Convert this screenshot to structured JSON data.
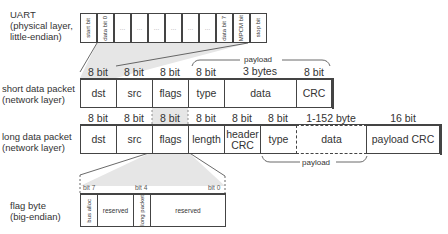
{
  "uart": {
    "label_lines": [
      "UART",
      "(physical layer,",
      " little-endian)"
    ],
    "cells": [
      "start bit",
      "data bit 0",
      "…",
      "…",
      "…",
      "…",
      "…",
      "…",
      "data bit 7",
      "MPCM bit",
      "stop bit"
    ]
  },
  "short_packet": {
    "label_lines": [
      "short data packet",
      "(network layer)"
    ],
    "payload_label": "payload",
    "widths": [
      "8 bit",
      "8 bit",
      "8 bit",
      "8 bit",
      "3 bytes",
      "8 bit"
    ],
    "fields": [
      "dst",
      "src",
      "flags",
      "type",
      "data",
      "CRC"
    ]
  },
  "long_packet": {
    "label_lines": [
      "long data packet",
      "(network layer)"
    ],
    "payload_label": "payload",
    "widths": [
      "8 bit",
      "8 bit",
      "8 bit",
      "8 bit",
      "8 bit",
      "8 bit",
      "1-152 byte",
      "16 bit"
    ],
    "fields": [
      "dst",
      "src",
      "flags",
      "length",
      "header CRC",
      "type",
      "data",
      "payload CRC"
    ]
  },
  "flag_byte": {
    "label_lines": [
      "flag byte",
      "(big-endian)"
    ],
    "bit_markers": [
      "bit 7",
      "bit 4",
      "bit 0"
    ],
    "fields": [
      "bus alloc",
      "reserved",
      "long packet",
      "reserved"
    ]
  },
  "colors": {
    "highlight": "#e2e2e2",
    "border": "#444444",
    "text": "#333333"
  }
}
